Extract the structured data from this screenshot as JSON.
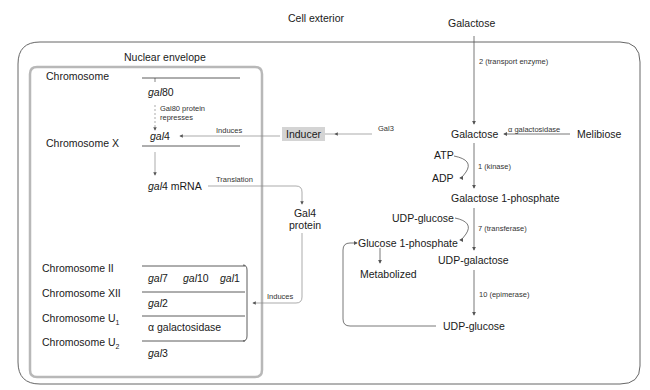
{
  "title_cell_exterior": "Cell exterior",
  "nucleus": {
    "title": "Nuclear envelope",
    "chromosomes": [
      {
        "name": "Chromosome",
        "genes": [
          {
            "prefix": "gal",
            "num": "80"
          }
        ]
      },
      {
        "name": "Chromosome X",
        "genes": [
          {
            "prefix": "gal",
            "num": "4"
          }
        ]
      },
      {
        "name": "Chromosome II",
        "genes": [
          {
            "prefix": "gal",
            "num": "7"
          },
          {
            "prefix": "gal",
            "num": "10"
          },
          {
            "prefix": "gal",
            "num": "1"
          }
        ]
      },
      {
        "name": "Chromosome XII",
        "genes": [
          {
            "prefix": "gal",
            "num": "2"
          }
        ]
      },
      {
        "name": "Chromosome U",
        "sub": "1",
        "genes": [
          {
            "text": "α galactosidase"
          }
        ]
      },
      {
        "name": "Chromosome U",
        "sub": "2",
        "genes": [
          {
            "prefix": "gal",
            "num": "3"
          }
        ]
      }
    ],
    "gal80_label": "Gal80 protein",
    "represses_label": "represses",
    "mrna_prefix": "gal",
    "mrna_suffix": "4 mRNA",
    "translation_label": "Translation",
    "induces_label_top": "Induces",
    "induces_label_bottom": "Induces"
  },
  "gal4_protein": {
    "line1": "Gal4",
    "line2": "protein"
  },
  "inducer": "Inducer",
  "gal3_label": "Gal3",
  "pathway": {
    "galactose_exterior": "Galactose",
    "transport_label": "2 (transport enzyme)",
    "galactose_interior": "Galactose",
    "alpha_gal_label": "α galactosidase",
    "melibiose": "Melibiose",
    "atp": "ATP",
    "adp": "ADP",
    "kinase_label": "1 (kinase)",
    "gal1p": "Galactose 1-phosphate",
    "udp_glucose_in": "UDP-glucose",
    "transferase_label": "7 (transferase)",
    "glucose1p": "Glucose 1-phosphate",
    "metabolized": "Metabolized",
    "udp_galactose": "UDP-galactose",
    "epimerase_label": "10 (epimerase)",
    "udp_glucose_out": "UDP-glucose"
  },
  "colors": {
    "line": "#555555",
    "nucleus_border": "#b8b8b8",
    "inducer_bg": "#d4d4d4"
  }
}
